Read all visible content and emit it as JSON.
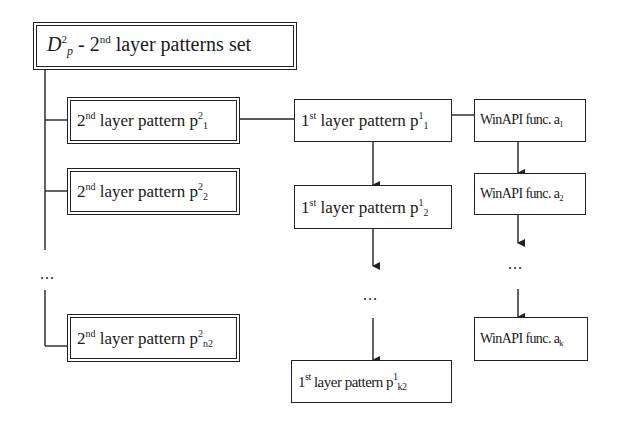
{
  "diagram": {
    "root": {
      "symbol": "D",
      "sup": "2",
      "sub": "p",
      "dash": " - ",
      "num": "2",
      "num_sup": "nd",
      "text": " layer patterns set"
    },
    "second_layer": [
      {
        "num": "2",
        "num_sup": "nd",
        "text": " layer pattern p",
        "sup": "2",
        "sub": "1"
      },
      {
        "num": "2",
        "num_sup": "nd",
        "text": " layer pattern p",
        "sup": "2",
        "sub": "2"
      },
      {
        "num": "2",
        "num_sup": "nd",
        "text": " layer pattern p",
        "sup": "2",
        "sub": "n2"
      }
    ],
    "second_layer_ellipsis": "...",
    "first_layer": [
      {
        "num": "1",
        "num_sup": "st",
        "text": " layer pattern p",
        "sup": "1",
        "sub": "1"
      },
      {
        "num": "1",
        "num_sup": "st",
        "text": " layer pattern p",
        "sup": "1",
        "sub": "2"
      },
      {
        "num": "1",
        "num_sup": "st",
        "text": " layer pattern p",
        "sup": "1",
        "sub": "k2"
      }
    ],
    "first_layer_ellipsis": "...",
    "winapi": [
      {
        "text": "WinAPI func. a",
        "sub": "1"
      },
      {
        "text": "WinAPI func. a",
        "sub": "2"
      },
      {
        "text": "WinAPI func. a",
        "sub": "k"
      }
    ],
    "winapi_ellipsis": "...",
    "colors": {
      "line": "#222222",
      "background": "#ffffff",
      "bleed_text": "#ececec"
    }
  }
}
